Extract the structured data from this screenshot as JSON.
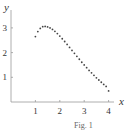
{
  "chart_data": {
    "type": "scatter",
    "title": "",
    "xlabel": "x",
    "ylabel": "y",
    "xlim": [
      0,
      4.2
    ],
    "ylim": [
      0,
      3.6
    ],
    "xticks": [
      1,
      2,
      3,
      4
    ],
    "yticks": [
      1,
      2,
      3
    ],
    "grid": false,
    "legend": null,
    "series": [
      {
        "name": "points",
        "x": [
          1.0,
          1.1,
          1.2,
          1.3,
          1.4,
          1.5,
          1.6,
          1.7,
          1.8,
          1.9,
          2.0,
          2.1,
          2.2,
          2.3,
          2.4,
          2.5,
          2.6,
          2.7,
          2.8,
          2.9,
          3.0,
          3.1,
          3.2,
          3.3,
          3.4,
          3.5,
          3.6,
          3.7,
          3.8,
          3.9,
          4.0
        ],
        "values": [
          2.65,
          2.85,
          2.98,
          3.05,
          3.06,
          3.04,
          3.0,
          2.94,
          2.86,
          2.77,
          2.67,
          2.56,
          2.45,
          2.33,
          2.21,
          2.09,
          1.97,
          1.85,
          1.73,
          1.61,
          1.5,
          1.39,
          1.28,
          1.18,
          1.08,
          0.98,
          0.89,
          0.8,
          0.71,
          0.63,
          0.45
        ]
      }
    ]
  },
  "caption": "Fig. 1"
}
